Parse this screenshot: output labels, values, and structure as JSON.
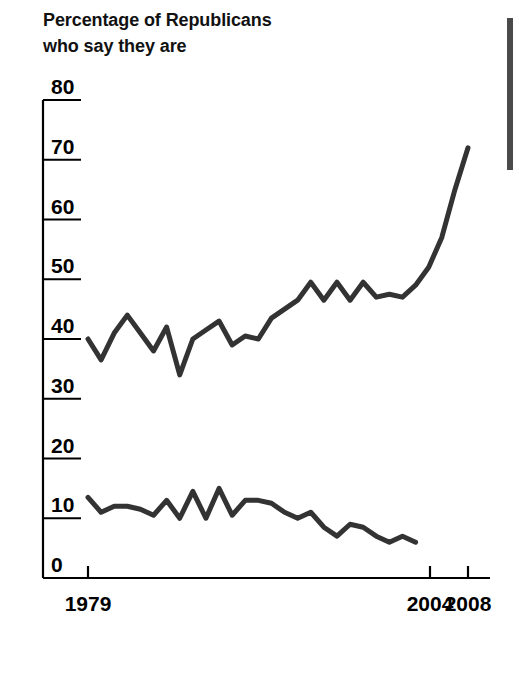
{
  "title": {
    "line1": "Percentage of Republicans",
    "line2": "who say they are"
  },
  "decor": {
    "gutter_rule_name": "column-rule"
  },
  "chart_data": {
    "type": "line",
    "title": "Percentage of Republicans who say they are",
    "subtitle": "",
    "xlabel": "",
    "ylabel": "",
    "xlim": [
      1979,
      2008
    ],
    "ylim": [
      0,
      80
    ],
    "grid": false,
    "legend": "none",
    "y_ticks": [
      0,
      10,
      20,
      30,
      40,
      50,
      60,
      70,
      80
    ],
    "y_tick_labels": [
      "0",
      "10",
      "20",
      "30",
      "40",
      "50",
      "60",
      "70",
      "80"
    ],
    "x_ticks": [
      1979,
      2004,
      2008
    ],
    "x_tick_labels": [
      "1979",
      "2004",
      "2008"
    ],
    "line_color": "#333333",
    "line_width": 5,
    "series": [
      {
        "name": "upper-line",
        "x": [
          1979,
          1980,
          1981,
          1982,
          1983,
          1984,
          1985,
          1986,
          1987,
          1988,
          1989,
          1990,
          1991,
          1992,
          1993,
          1994,
          1995,
          1996,
          1997,
          1998,
          1999,
          2000,
          2001,
          2002,
          2003,
          2004,
          2005,
          2006,
          2007,
          2008
        ],
        "values": [
          40,
          36.5,
          41,
          44,
          41,
          38,
          42,
          34,
          40,
          41.5,
          43,
          39,
          40.5,
          40,
          43.5,
          45,
          46.5,
          49.5,
          46.5,
          49.5,
          46.5,
          49.5,
          47,
          47.5,
          47,
          49,
          52,
          57,
          65,
          72
        ]
      },
      {
        "name": "lower-line",
        "x": [
          1979,
          1980,
          1981,
          1982,
          1983,
          1984,
          1985,
          1986,
          1987,
          1988,
          1989,
          1990,
          1991,
          1992,
          1993,
          1994,
          1995,
          1996,
          1997,
          1998,
          1999,
          2000,
          2001,
          2002,
          2003,
          2004
        ],
        "values": [
          13.5,
          11,
          12,
          12,
          11.5,
          10.5,
          13,
          10,
          14.5,
          10,
          15,
          10.5,
          13,
          13,
          12.5,
          11,
          10,
          11,
          8.5,
          7,
          9,
          8.5,
          7,
          6,
          7,
          6
        ]
      }
    ]
  }
}
